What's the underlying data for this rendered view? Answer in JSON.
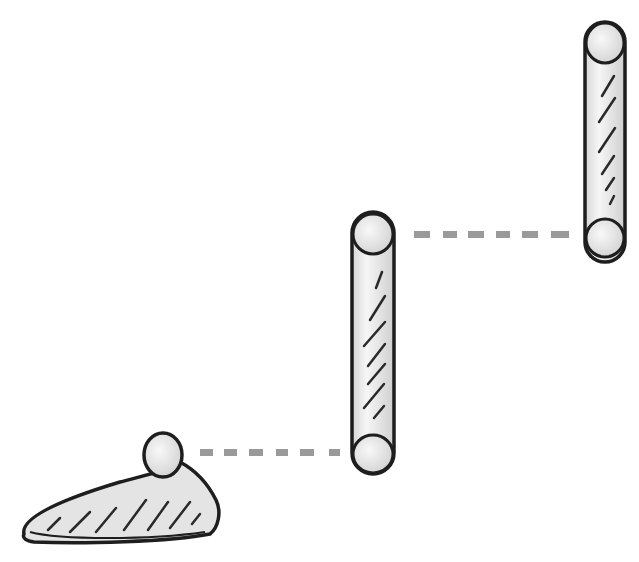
{
  "diagram": {
    "style": "hand-drawn pencil sketch",
    "colors": {
      "background": "#ffffff",
      "outline": "#1e1e1e",
      "fill": "#e6e6e6",
      "highlight": "#f4f4f4",
      "hatch": "#2a2a2a",
      "connector": "#9a9a9a"
    },
    "shapes": [
      {
        "id": "base",
        "type": "wedge-foot",
        "description": "Tapered foot-shaped base with round knob on top"
      },
      {
        "id": "pillar-middle",
        "type": "vertical-cylinder",
        "description": "Tall vertical rounded bar, center"
      },
      {
        "id": "pillar-right",
        "type": "vertical-cylinder",
        "description": "Tall vertical rounded bar, upper right"
      }
    ],
    "connectors": [
      {
        "id": "link-base-to-middle",
        "from": "base",
        "to": "pillar-middle",
        "style": "dashed",
        "dashes": 6
      },
      {
        "id": "link-middle-to-right",
        "from": "pillar-middle",
        "to": "pillar-right",
        "style": "dashed",
        "dashes": 6
      }
    ]
  }
}
